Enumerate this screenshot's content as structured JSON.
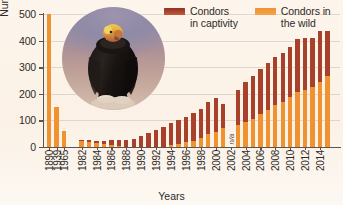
{
  "chart_data": {
    "type": "bar",
    "title": "",
    "xlabel": "Years",
    "ylabel": "Number of condors",
    "ylim": [
      0,
      500
    ],
    "yticks": [
      0,
      100,
      200,
      300,
      400,
      500
    ],
    "grid": true,
    "stacked": true,
    "legend_position": "top-right",
    "categories": [
      "1890",
      "1939",
      "1965",
      "1982",
      "1983",
      "1984",
      "1985",
      "1986",
      "1987",
      "1988",
      "1989",
      "1990",
      "1991",
      "1992",
      "1993",
      "1994",
      "1995",
      "1996",
      "1997",
      "1998",
      "1999",
      "2000",
      "2001",
      "2002",
      "2003",
      "2004",
      "2005",
      "2006",
      "2007",
      "2008",
      "2009",
      "2010",
      "2011",
      "2012",
      "2013",
      "2014",
      "2015"
    ],
    "series": [
      {
        "name": "Condors in the wild",
        "color": "#f0922f",
        "values": [
          500,
          150,
          60,
          22,
          19,
          15,
          12,
          9,
          5,
          0,
          0,
          0,
          0,
          0,
          0,
          8,
          13,
          17,
          22,
          33,
          48,
          56,
          70,
          null,
          83,
          93,
          105,
          125,
          140,
          158,
          170,
          187,
          205,
          215,
          226,
          245,
          268
        ]
      },
      {
        "name": "Condors in captivity",
        "color": "#a8412c",
        "values": [
          0,
          0,
          0,
          5,
          6,
          9,
          12,
          16,
          22,
          27,
          32,
          40,
          52,
          63,
          75,
          83,
          90,
          97,
          105,
          110,
          120,
          129,
          90,
          null,
          132,
          150,
          163,
          167,
          177,
          182,
          185,
          190,
          200,
          193,
          185,
          190,
          167
        ]
      }
    ],
    "totals": [
      500,
      150,
      60,
      27,
      25,
      24,
      24,
      25,
      27,
      27,
      32,
      40,
      52,
      63,
      75,
      91,
      103,
      114,
      127,
      143,
      168,
      185,
      160,
      null,
      215,
      243,
      268,
      292,
      317,
      340,
      355,
      377,
      405,
      408,
      411,
      435,
      435
    ],
    "annotations": [
      {
        "category": "2002",
        "text": "n/a"
      }
    ],
    "gap_after_category": "1965",
    "photo": {
      "alt": "california-condor-photo",
      "shape": "circle"
    }
  },
  "legend": {
    "items": [
      {
        "label": "Condors\nin captivity",
        "color": "#a8412c"
      },
      {
        "label": "Condors in\nthe wild",
        "color": "#f0922f"
      }
    ]
  },
  "axes": {
    "y_title": "Number of condors",
    "x_title": "Years",
    "y_tick_labels": [
      "0",
      "100",
      "200",
      "300",
      "400",
      "500"
    ],
    "x_tick_labels_shown": [
      "1890",
      "1939",
      "1965",
      "1982",
      "1984",
      "1986",
      "1988",
      "1990",
      "1992",
      "1994",
      "1996",
      "1998",
      "2000",
      "2002",
      "2004",
      "2006",
      "2008",
      "2010",
      "2012",
      "2014"
    ]
  }
}
